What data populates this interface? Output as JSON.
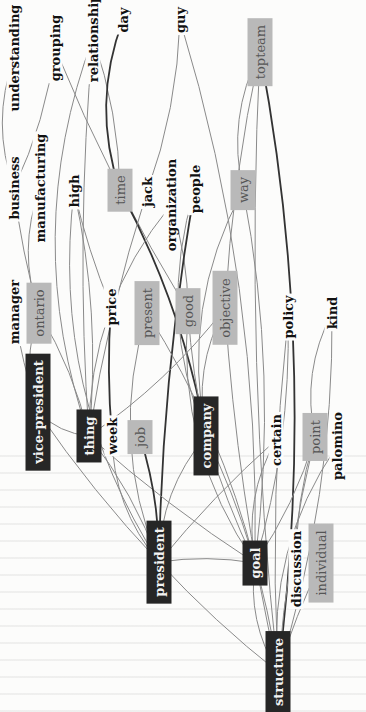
{
  "diagram": {
    "orientation": "rotated -90deg",
    "node_styles": {
      "black": "#262626",
      "gray": "#b9b9b9",
      "plain": "#fcfcfb"
    },
    "edge_color": "#8a8a8a",
    "strong_edge_color": "#333333",
    "nodes": [
      {
        "id": "understanding",
        "label": "understanding",
        "style": "plain",
        "x": 14,
        "y": 58
      },
      {
        "id": "grouping",
        "label": "grouping",
        "style": "plain",
        "x": 55,
        "y": 48
      },
      {
        "id": "relationship",
        "label": "relationship",
        "style": "plain",
        "x": 93,
        "y": 38
      },
      {
        "id": "day",
        "label": "day",
        "style": "plain",
        "x": 123,
        "y": 20
      },
      {
        "id": "guy",
        "label": "guy",
        "style": "plain",
        "x": 180,
        "y": 20
      },
      {
        "id": "business",
        "label": "business",
        "style": "plain",
        "x": 14,
        "y": 188
      },
      {
        "id": "manufacturing",
        "label": "manufacturing",
        "style": "plain",
        "x": 40,
        "y": 188
      },
      {
        "id": "high",
        "label": "high",
        "style": "plain",
        "x": 74,
        "y": 191
      },
      {
        "id": "time",
        "label": "time",
        "style": "gray",
        "x": 120,
        "y": 190
      },
      {
        "id": "jack",
        "label": "jack",
        "style": "plain",
        "x": 147,
        "y": 192
      },
      {
        "id": "organization",
        "label": "organization",
        "style": "plain",
        "x": 171,
        "y": 205
      },
      {
        "id": "people",
        "label": "people",
        "style": "plain",
        "x": 195,
        "y": 189
      },
      {
        "id": "way",
        "label": "way",
        "style": "gray",
        "x": 243,
        "y": 190
      },
      {
        "id": "topteam",
        "label": "topteam",
        "style": "gray",
        "x": 260,
        "y": 52
      },
      {
        "id": "manager",
        "label": "manager",
        "style": "plain",
        "x": 14,
        "y": 312
      },
      {
        "id": "ontario",
        "label": "ontario",
        "style": "gray",
        "x": 39,
        "y": 313
      },
      {
        "id": "price",
        "label": "price",
        "style": "plain",
        "x": 111,
        "y": 307
      },
      {
        "id": "present",
        "label": "present",
        "style": "gray",
        "x": 147,
        "y": 313
      },
      {
        "id": "good",
        "label": "good",
        "style": "gray",
        "x": 188,
        "y": 311
      },
      {
        "id": "objective",
        "label": "objective",
        "style": "gray",
        "x": 225,
        "y": 308
      },
      {
        "id": "policy",
        "label": "policy",
        "style": "plain",
        "x": 288,
        "y": 317
      },
      {
        "id": "kind",
        "label": "kind",
        "style": "plain",
        "x": 332,
        "y": 313
      },
      {
        "id": "vice-president",
        "label": "vice-president",
        "style": "black",
        "x": 38,
        "y": 412
      },
      {
        "id": "thing",
        "label": "thing",
        "style": "black",
        "x": 89,
        "y": 436
      },
      {
        "id": "week",
        "label": "week",
        "style": "plain",
        "x": 112,
        "y": 436
      },
      {
        "id": "job",
        "label": "job",
        "style": "gray",
        "x": 140,
        "y": 437
      },
      {
        "id": "company",
        "label": "company",
        "style": "black",
        "x": 206,
        "y": 436
      },
      {
        "id": "certain",
        "label": "certain",
        "style": "plain",
        "x": 276,
        "y": 440
      },
      {
        "id": "point",
        "label": "point",
        "style": "gray",
        "x": 315,
        "y": 437
      },
      {
        "id": "palomino",
        "label": "palomino",
        "style": "plain",
        "x": 337,
        "y": 446
      },
      {
        "id": "president",
        "label": "president",
        "style": "black",
        "x": 159,
        "y": 562
      },
      {
        "id": "goal",
        "label": "goal",
        "style": "black",
        "x": 255,
        "y": 563
      },
      {
        "id": "discussion",
        "label": "discussion",
        "style": "plain",
        "x": 296,
        "y": 569
      },
      {
        "id": "individual",
        "label": "individual",
        "style": "gray",
        "x": 321,
        "y": 563
      },
      {
        "id": "structure",
        "label": "structure",
        "style": "black",
        "x": 278,
        "y": 672
      }
    ],
    "edges": [
      [
        "understanding",
        "business"
      ],
      [
        "grouping",
        "business"
      ],
      [
        "grouping",
        "good"
      ],
      [
        "relationship",
        "thing"
      ],
      [
        "relationship",
        "time"
      ],
      [
        "relationship",
        "thing"
      ],
      [
        "day",
        "time",
        1
      ],
      [
        "guy",
        "jack"
      ],
      [
        "business",
        "ontario"
      ],
      [
        "manufacturing",
        "ontario"
      ],
      [
        "high",
        "thing"
      ],
      [
        "high",
        "price"
      ],
      [
        "high",
        "president"
      ],
      [
        "time",
        "company",
        1
      ],
      [
        "jack",
        "thing"
      ],
      [
        "organization",
        "thing"
      ],
      [
        "organization",
        "good"
      ],
      [
        "people",
        "president",
        1
      ],
      [
        "people",
        "company"
      ],
      [
        "guy",
        "goal"
      ],
      [
        "topteam",
        "objective"
      ],
      [
        "topteam",
        "way"
      ],
      [
        "topteam",
        "structure",
        1
      ],
      [
        "topteam",
        "structure"
      ],
      [
        "way",
        "company"
      ],
      [
        "way",
        "goal"
      ],
      [
        "manager",
        "vice-president"
      ],
      [
        "ontario",
        "vice-president"
      ],
      [
        "ontario",
        "thing"
      ],
      [
        "price",
        "week",
        1
      ],
      [
        "present",
        "president"
      ],
      [
        "present",
        "goal"
      ],
      [
        "good",
        "company"
      ],
      [
        "good",
        "goal"
      ],
      [
        "objective",
        "thing"
      ],
      [
        "objective",
        "structure"
      ],
      [
        "objective",
        "company"
      ],
      [
        "policy",
        "goal"
      ],
      [
        "policy",
        "structure"
      ],
      [
        "kind",
        "point"
      ],
      [
        "kind",
        "structure"
      ],
      [
        "vice-president",
        "president"
      ],
      [
        "vice-president",
        "thing"
      ],
      [
        "thing",
        "president"
      ],
      [
        "thing",
        "goal"
      ],
      [
        "week",
        "president"
      ],
      [
        "job",
        "president",
        1
      ],
      [
        "company",
        "goal"
      ],
      [
        "company",
        "president"
      ],
      [
        "company",
        "structure"
      ],
      [
        "certain",
        "president"
      ],
      [
        "certain",
        "goal"
      ],
      [
        "point",
        "goal"
      ],
      [
        "point",
        "structure"
      ],
      [
        "palomino",
        "structure"
      ],
      [
        "discussion",
        "point"
      ],
      [
        "individual",
        "structure"
      ],
      [
        "goal",
        "structure"
      ],
      [
        "president",
        "goal"
      ],
      [
        "president",
        "structure"
      ]
    ]
  }
}
